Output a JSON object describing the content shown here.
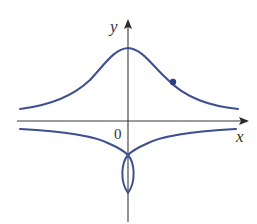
{
  "figure": {
    "type": "curve-plot",
    "axes": {
      "x_label": "x",
      "y_label": "y",
      "origin_label": "0"
    },
    "colors": {
      "curve": "#3d4f8f",
      "axis": "#3a3a3a",
      "background": "#ffffff"
    },
    "curves": [
      {
        "name": "upper-bell-branch",
        "description": "Bell-shaped branch above x-axis, maximum on y-axis, approaching horizontal asymptote above the x-axis"
      },
      {
        "name": "lower-branch-with-loop",
        "description": "Branch below x-axis approaching asymptote from below, meeting at a point on negative y-axis and forming a small closed loop along the y-axis"
      }
    ],
    "marked_point": {
      "description": "Point on the right side of the upper branch"
    }
  }
}
